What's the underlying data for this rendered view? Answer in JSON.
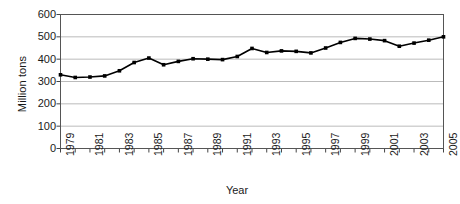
{
  "chart_data": {
    "type": "line",
    "title": "",
    "subtitle": "",
    "xlabel": "Year",
    "ylabel": "Million tons",
    "xlim": [
      1979,
      2005
    ],
    "ylim": [
      0,
      600
    ],
    "ytick_values": [
      0,
      100,
      200,
      300,
      400,
      500,
      600
    ],
    "ytick_labels": [
      "0",
      "100",
      "200",
      "300",
      "400",
      "500",
      "600"
    ],
    "xtick_values": [
      1979,
      1981,
      1983,
      1985,
      1987,
      1989,
      1991,
      1993,
      1995,
      1997,
      1999,
      2001,
      2003,
      2005
    ],
    "xtick_labels": [
      "1979",
      "1981",
      "1983",
      "1985",
      "1987",
      "1989",
      "1991",
      "1993",
      "1995",
      "1997",
      "1999",
      "2001",
      "2003",
      "2005"
    ],
    "grid": "horizontal",
    "legend": "none",
    "marker": "square",
    "line_color": "#000000",
    "marker_color": "#000000",
    "grid_color": "#aaaaaa",
    "axis_color": "#444444",
    "background_color": "#ffffff",
    "x": [
      1979,
      1980,
      1981,
      1982,
      1983,
      1984,
      1985,
      1986,
      1987,
      1988,
      1989,
      1990,
      1991,
      1992,
      1993,
      1994,
      1995,
      1996,
      1997,
      1998,
      1999,
      2000,
      2001,
      2002,
      2003,
      2004,
      2005
    ],
    "values": [
      330,
      318,
      320,
      325,
      348,
      385,
      405,
      375,
      390,
      402,
      400,
      398,
      412,
      448,
      430,
      437,
      435,
      428,
      450,
      475,
      493,
      490,
      483,
      458,
      472,
      485,
      500
    ],
    "series": [
      {
        "name": "Million tons",
        "values": [
          330,
          318,
          320,
          325,
          348,
          385,
          405,
          375,
          390,
          402,
          400,
          398,
          412,
          448,
          430,
          437,
          435,
          428,
          450,
          475,
          493,
          490,
          483,
          458,
          472,
          485,
          500
        ]
      }
    ]
  },
  "axes": {
    "ylabel": "Million tons",
    "xlabel": "Year"
  }
}
